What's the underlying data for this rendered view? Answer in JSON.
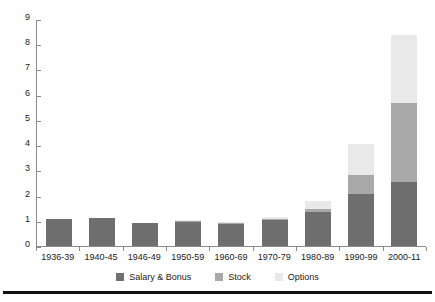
{
  "chart_data": {
    "type": "bar",
    "subtype": "stacked-bar",
    "title": "",
    "subtitle": "",
    "xlabel": "",
    "ylabel": "",
    "ylim": [
      0,
      9
    ],
    "ytick_step": 1,
    "yticks": [
      9,
      8,
      7,
      6,
      5,
      4,
      3,
      2,
      1,
      0
    ],
    "grid": false,
    "legend_position": "bottom",
    "categories": [
      "1936-39",
      "1940-45",
      "1946-49",
      "1950-59",
      "1960-69",
      "1970-79",
      "1980-89",
      "1990-99",
      "2000-11"
    ],
    "series": [
      {
        "name": "Salary & Bonus",
        "color": "#6e6e6e",
        "values": [
          1.08,
          1.1,
          0.9,
          0.95,
          0.88,
          1.02,
          1.35,
          2.05,
          2.53
        ]
      },
      {
        "name": "Stock",
        "color": "#a9a9a9",
        "values": [
          0.0,
          0.0,
          0.0,
          0.02,
          0.02,
          0.05,
          0.1,
          0.75,
          3.15
        ]
      },
      {
        "name": "Options",
        "color": "#e9e9e9",
        "values": [
          0.0,
          0.0,
          0.0,
          0.03,
          0.02,
          0.1,
          0.35,
          1.25,
          2.67
        ]
      }
    ],
    "totals": [
      1.08,
      1.1,
      0.9,
      1.0,
      0.92,
      1.17,
      1.8,
      4.05,
      8.35
    ]
  },
  "legend": {
    "items": [
      {
        "label": "Salary & Bonus",
        "color": "#6e6e6e"
      },
      {
        "label": "Stock",
        "color": "#a9a9a9"
      },
      {
        "label": "Options",
        "color": "#e9e9e9"
      }
    ]
  },
  "axis_colors": {
    "line": "#8a8a8a",
    "text": "#1a1a1a",
    "rule": "#111111"
  }
}
